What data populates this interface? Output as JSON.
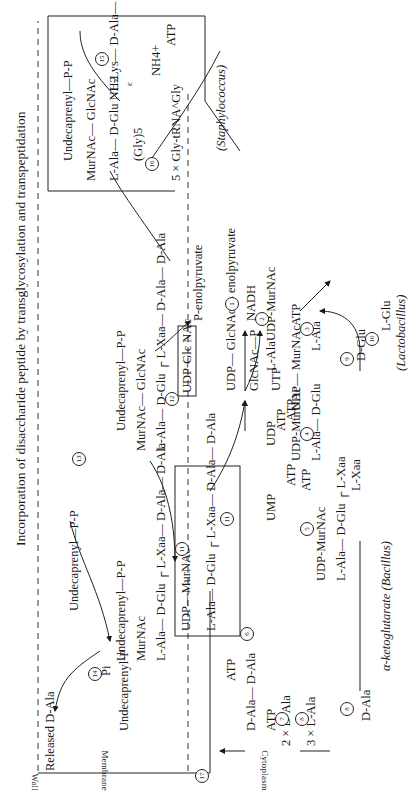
{
  "title": "Incorporation of disaccharide peptide by transglycosylation and transpeptidation",
  "compartments": {
    "wall": "Wall",
    "membrane": "Membrane",
    "cytoplasm": "Cytoplasm"
  },
  "released": "Released D-Ala",
  "organisms": {
    "staph": "(Staphylococcus)",
    "bacillus": "α-ketoglutarate (Bacillus)",
    "lactobacillus": "(Lactobacillus)"
  },
  "staph_box": {
    "lipid": "Undecaprenyl—P-P",
    "sugar": "MurNAc— GlcNAc",
    "peptide_a": "L-Ala— D-Glu NH2",
    "peptide_b": "L-Lys— D-Ala— D-Ala",
    "epsilon": "ε",
    "gly": "(Gly)5",
    "nh4": "NH4+",
    "atp": "ATP",
    "gly_trna": "5 × Gly-tRNA^Gly"
  },
  "lipid_intermediates": {
    "undecaprenyl_pp": "Undecaprenyl—P-P",
    "undecaprenyl_p": "Undecaprenyl-P",
    "pi": "Pi",
    "lipid1_lipid": "Undecaprenyl—P-P",
    "lipid1_sugar": "MurNAc",
    "lipid1_peptide": "L-Ala— D-Glu ┌ L-Xaa— D-Ala— D-Ala",
    "lipid2_lipid": "Undecaprenyl—P-P",
    "lipid2_sugar": "MurNAc— GlcNAc",
    "lipid2_peptide": "L-Ala— D-Glu ┌ L-Xaa— D-Ala— D-Ala"
  },
  "udp_box": {
    "head": "UDP—MurNAc",
    "peptide": "L-Ala— D-Glu ┌ L-Xaa— D-Ala— D-Ala"
  },
  "cytoplasm_species": {
    "udp_glcnac": "UDP-Glc NAc",
    "p_enolpyruvate": "P-enolpyruvate",
    "udp_glcnac_enolpyruvate": "UDP— GlcNAc— enolpyruvate",
    "nadh": "NADH",
    "udp_murnac": "UDP-MurNAc",
    "udp_murnac_ala_head": "UDP— MurNAc",
    "udp_murnac_ala_tail": "L-Ala",
    "l_ala_in": "L-Ala",
    "atp_3": "ATP",
    "udp_murnac_glu": "UDP-MurNAc",
    "udp_murnac_glu_tail": "L-Ala— D-Glu",
    "atp_4": "ATP",
    "d_glu": "D-Glu",
    "l_glu": "L-Glu",
    "udp_murnac_xaa": "UDP-MurNAc",
    "udp_murnac_xaa_tail": "L-Ala— D-Glu ┌ L-Xaa",
    "l_xaa": "L-Xaa",
    "atp_5": "ATP",
    "glcnac_p": "GlcNAc—P",
    "utp": "UTP",
    "udp": "UDP",
    "ump": "UMP",
    "atp_udp": "ATP",
    "atp_ump": "ATP",
    "d_ala_d_ala": "D-Ala— D-Ala",
    "atp_6": "ATP",
    "atp_7": "ATP",
    "two_d_ala": "2 × D-Ala",
    "three_l_ala": "3 × L-Ala",
    "d_ala": "D-Ala"
  },
  "step_numbers": [
    "1",
    "2",
    "3",
    "4",
    "5",
    "6",
    "7",
    "8",
    "8",
    "9",
    "10",
    "11",
    "11",
    "12",
    "13",
    "14",
    "15",
    "16",
    "17"
  ],
  "colors": {
    "ink": "#1a1a1a",
    "background": "#ffffff"
  }
}
